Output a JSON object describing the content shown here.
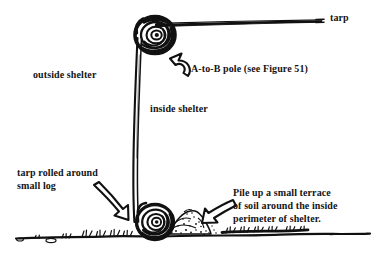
{
  "figure": {
    "background_color": "#ffffff",
    "ink_color": "#111111",
    "width": 385,
    "height": 258
  },
  "labels": {
    "tarp": "tarp",
    "outside_shelter": "outside shelter",
    "inside_shelter": "inside shelter",
    "a_to_b_pole": "A-to-B pole (see Figure 51)",
    "tarp_rolled": "tarp rolled around\nsmall log",
    "pile_soil": "Pile up a small terrace\nof soil around the inside\nperimeter of shelter."
  },
  "drawing": {
    "top_coil_name": "rolled-tarp-coil-top",
    "bottom_coil_name": "rolled-tarp-coil-bottom",
    "tarp_line_name": "tarp-roof-line",
    "wall_line_name": "tarp-wall-line",
    "ground_line_name": "ground-line",
    "soil_pile_name": "soil-terrace-pile",
    "arrows": [
      {
        "name": "arrow-to-pole",
        "direction": "up-left"
      },
      {
        "name": "arrow-to-rolled-log",
        "direction": "down-right"
      },
      {
        "name": "arrow-to-soil-pile",
        "direction": "down-left"
      }
    ]
  }
}
